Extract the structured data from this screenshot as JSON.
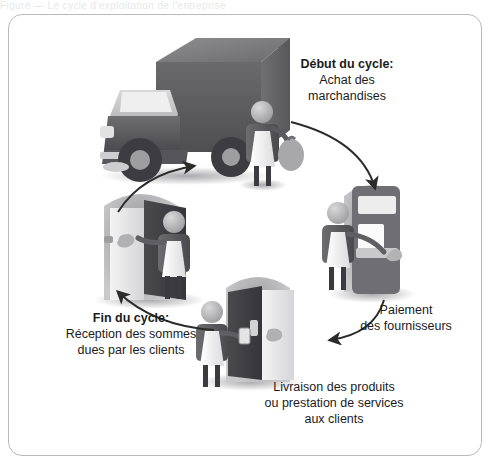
{
  "page": {
    "top_clipped_text": "Figure — Le cycle d'exploitation de l'entreprise",
    "frame_border_color": "#b9b9bc",
    "background_color": "#ffffff"
  },
  "diagram": {
    "type": "cycle",
    "title": "Cycle d'exploitation",
    "direction": "clockwise",
    "arrow_color": "#2b2b2b",
    "ink_color": "#1b1b1b",
    "labels": [
      {
        "id": "start",
        "name": "debut-du-cycle-label",
        "heading": "Début du cycle:",
        "line2": "Achat des",
        "line3": "marchandises",
        "bold_heading": true,
        "position": "top-right"
      },
      {
        "id": "supplier",
        "name": "paiement-des-fournisseurs-label",
        "heading": "Paiement",
        "line2": "des fournisseurs",
        "line3": "",
        "bold_heading": false,
        "position": "right"
      },
      {
        "id": "delivery",
        "name": "livraison-des-produits-label",
        "heading": "Livraison des produits",
        "line2": "ou prestation de services",
        "line3": "aux clients",
        "bold_heading": false,
        "position": "bottom"
      },
      {
        "id": "end",
        "name": "fin-du-cycle-label",
        "heading": "Fin du cycle:",
        "line2": "Réception des sommes",
        "line3": "dues par les clients",
        "bold_heading": true,
        "position": "left"
      }
    ],
    "scenes": [
      {
        "id": "truck",
        "name": "delivery-truck-scene",
        "description": "Camion de livraison avec personne portant un sac de marchandises",
        "icons": [
          "truck-icon",
          "person-with-sack-icon"
        ]
      },
      {
        "id": "counter",
        "name": "supplier-counter-scene",
        "description": "Personne payant au guichet du fournisseur",
        "icons": [
          "service-counter-icon",
          "person-paying-icon"
        ]
      },
      {
        "id": "door-delivery",
        "name": "client-delivery-door-scene",
        "description": "Personne livrant un produit à la porte du client",
        "icons": [
          "open-door-icon",
          "person-delivering-icon",
          "hand-receiving-icon"
        ]
      },
      {
        "id": "door-collect",
        "name": "client-payment-door-scene",
        "description": "Personne recevant le paiement à la porte du client",
        "icons": [
          "open-door-icon",
          "person-collecting-icon",
          "hand-giving-icon"
        ]
      }
    ],
    "arrows": [
      {
        "id": "a1",
        "name": "arrow-truck-to-counter",
        "from": "truck",
        "to": "counter"
      },
      {
        "id": "a2",
        "name": "arrow-counter-to-door-delivery",
        "from": "counter",
        "to": "door-delivery"
      },
      {
        "id": "a3",
        "name": "arrow-door-delivery-to-door-collect",
        "from": "door-delivery",
        "to": "door-collect"
      },
      {
        "id": "a4",
        "name": "arrow-door-collect-to-truck",
        "from": "door-collect",
        "to": "truck"
      }
    ]
  }
}
